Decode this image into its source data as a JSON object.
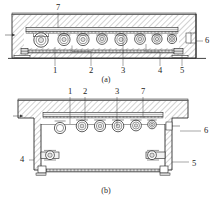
{
  "figure": {
    "captions": [
      {
        "id": "cap-a",
        "text": "(a)"
      },
      {
        "id": "cap-b",
        "text": "(b)"
      }
    ]
  },
  "view_a": {
    "name": "view-a",
    "caption": "(a)",
    "callouts_top": [
      {
        "ref": "7",
        "x": 58,
        "y": 8
      }
    ],
    "callouts_right": [
      {
        "ref": "6",
        "x": 207,
        "y": 41
      }
    ],
    "callouts_bottom": [
      {
        "ref": "1",
        "x": 55,
        "y": 71
      },
      {
        "ref": "2",
        "x": 91,
        "y": 71
      },
      {
        "ref": "3",
        "x": 123,
        "y": 71
      },
      {
        "ref": "4",
        "x": 160,
        "y": 71
      },
      {
        "ref": "5",
        "x": 182,
        "y": 71
      }
    ],
    "roller_count": 8
  },
  "view_b": {
    "name": "view-b",
    "caption": "(b)",
    "callouts_top": [
      {
        "ref": "1",
        "x": 70,
        "y": 92
      },
      {
        "ref": "2",
        "x": 85,
        "y": 92
      },
      {
        "ref": "3",
        "x": 117,
        "y": 92
      },
      {
        "ref": "7",
        "x": 143,
        "y": 92
      }
    ],
    "callouts_left": [
      {
        "ref": "4",
        "x": 22,
        "y": 160
      }
    ],
    "callouts_right": [
      {
        "ref": "6",
        "x": 206,
        "y": 131
      },
      {
        "ref": "5",
        "x": 194,
        "y": 165
      }
    ],
    "roller_count": 6
  },
  "colors": {
    "line": "#1f1f1f",
    "hatch": "#555555",
    "label": "#1c1c1c",
    "background": "#ffffff",
    "fill_light": "#f2f2f2",
    "fill_mid": "#dedede"
  },
  "parts_legend": {
    "1": "1",
    "2": "2",
    "3": "3",
    "4": "4",
    "5": "5",
    "6": "6",
    "7": "7"
  }
}
